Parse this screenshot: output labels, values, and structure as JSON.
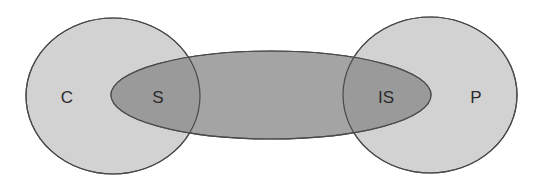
{
  "diagram": {
    "type": "venn-like",
    "colors": {
      "circle_fill": "#d2d2d2",
      "ellipse_fill": "#a4a4a4",
      "overlap_fill": "#9a9a9a",
      "stroke": "#4a4a4a",
      "label": "#2a2a2a"
    },
    "shapes": [
      {
        "id": "left-circle",
        "label": "C",
        "cx": 113,
        "cy": 96,
        "rx": 87,
        "ry": 78
      },
      {
        "id": "right-circle",
        "label": "P",
        "cx": 430,
        "cy": 95,
        "rx": 87,
        "ry": 78
      },
      {
        "id": "middle-ellipse",
        "cx": 271,
        "cy": 95,
        "rx": 160,
        "ry": 44
      }
    ],
    "labels": {
      "c": "C",
      "s": "S",
      "is": "IS",
      "p": "P"
    }
  }
}
